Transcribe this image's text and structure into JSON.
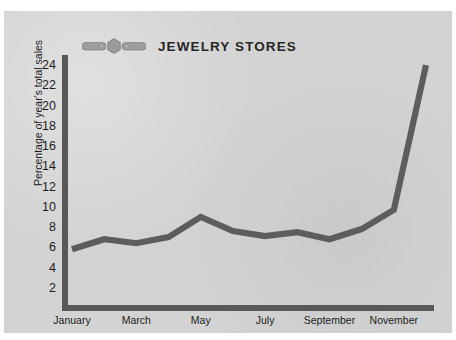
{
  "panel": {
    "background_color": "#d3d3d3",
    "page_background_color": "#ffffff"
  },
  "header": {
    "title": "JEWELRY STORES",
    "icon": "ring-icon",
    "icon_color": "#9a9a9a",
    "title_color": "#262626"
  },
  "axis_style": {
    "axis_color": "#585858",
    "series_color": "#5d5d5d",
    "tick_label_color": "#1d1d1d"
  },
  "chart_data": {
    "type": "line",
    "title": "JEWELRY STORES",
    "xlabel": "",
    "ylabel": "Percentage of year's total sales",
    "ylim": [
      0,
      25
    ],
    "yticks": [
      2,
      4,
      6,
      8,
      10,
      12,
      14,
      16,
      18,
      20,
      22,
      24
    ],
    "ytick_labels": [
      "2",
      "4",
      "6",
      "8",
      "10",
      "12",
      "14",
      "16",
      "18",
      "20",
      "22",
      "24"
    ],
    "grid": false,
    "legend": false,
    "categories": [
      "January",
      "February",
      "March",
      "April",
      "May",
      "June",
      "July",
      "August",
      "September",
      "October",
      "November",
      "December"
    ],
    "xtick_labels": [
      "January",
      "March",
      "May",
      "July",
      "September",
      "November"
    ],
    "xtick_categories": [
      "January",
      "March",
      "May",
      "July",
      "September",
      "November"
    ],
    "series": [
      {
        "name": "Percentage of year's total sales",
        "values": [
          5.8,
          6.8,
          6.4,
          7.0,
          9.0,
          7.6,
          7.1,
          7.5,
          6.8,
          7.8,
          9.7,
          24.0
        ]
      }
    ]
  }
}
